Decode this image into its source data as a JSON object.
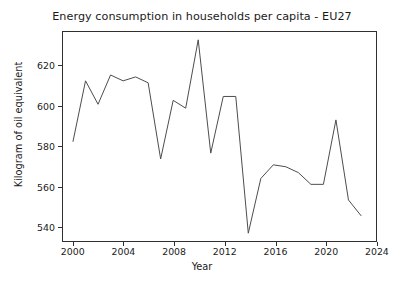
{
  "chart_data": {
    "type": "line",
    "title": "Energy consumption in households per capita - EU27",
    "xlabel": "Year",
    "ylabel": "Kilogram of oil equivalent",
    "xlim": [
      1999.2,
      2024.2
    ],
    "ylim": [
      527,
      634
    ],
    "xticks": [
      2000,
      2004,
      2008,
      2012,
      2016,
      2020,
      2024
    ],
    "yticks": [
      540,
      560,
      580,
      600,
      620
    ],
    "grid": false,
    "legend": null,
    "line_color": "#4d4d4d",
    "x": [
      2000,
      2001,
      2002,
      2003,
      2004,
      2005,
      2006,
      2007,
      2008,
      2009,
      2010,
      2011,
      2012,
      2013,
      2014,
      2015,
      2016,
      2017,
      2018,
      2019,
      2020,
      2021,
      2022,
      2023
    ],
    "values": [
      578,
      609,
      597,
      612,
      609,
      611,
      608,
      569,
      599,
      595,
      630,
      572,
      601,
      601,
      531,
      559,
      566,
      565,
      562,
      556,
      556,
      589,
      548,
      540
    ],
    "series": [
      {
        "name": "Energy consumption in households per capita - EU27",
        "values": [
          578,
          609,
          597,
          612,
          609,
          611,
          608,
          569,
          599,
          595,
          630,
          572,
          601,
          601,
          531,
          559,
          566,
          565,
          562,
          556,
          556,
          589,
          548,
          540
        ]
      }
    ]
  },
  "axis": {
    "ytick_labels": [
      "620",
      "600",
      "580",
      "560",
      "540"
    ],
    "xtick_labels": [
      "2000",
      "2004",
      "2008",
      "2012",
      "2016",
      "2020",
      "2024"
    ]
  }
}
